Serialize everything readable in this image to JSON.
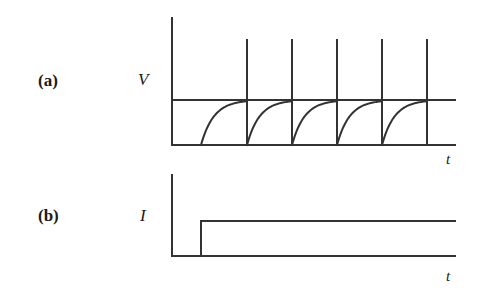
{
  "figure": {
    "background": "#ffffff",
    "line_color": "#333333",
    "width": 477,
    "height": 294
  },
  "panels": [
    {
      "id": "a",
      "label": "(a)",
      "label_x": 38,
      "label_y": 72,
      "y_axis_label": "V",
      "y_axis_label_x": 138,
      "y_axis_label_y": 71,
      "x_axis_label": "t",
      "x_axis_label_x": 446,
      "x_axis_label_y": 152,
      "quantity": "voltage"
    },
    {
      "id": "b",
      "label": "(b)",
      "label_x": 38,
      "label_y": 207,
      "y_axis_label": "I",
      "y_axis_label_x": 140,
      "y_axis_label_y": 207,
      "x_axis_label": "t",
      "x_axis_label_x": 446,
      "x_axis_label_y": 269,
      "quantity": "current"
    }
  ],
  "chart_data": [
    {
      "type": "line",
      "title": "(a) Voltage versus time",
      "xlabel": "t",
      "ylabel": "V",
      "grid": false,
      "legend": false,
      "axes": {
        "origin_x": 172,
        "baseline_y": 145,
        "axis_top_y": 18,
        "axis_right_x": 455
      },
      "levels": {
        "baseline": 145,
        "plateau": 100,
        "spike_top": 40
      },
      "plateau_line": {
        "x_start": 172,
        "x_end": 455,
        "y": 100
      },
      "spikes": [
        {
          "x": 247,
          "y_top": 40,
          "y_bottom": 145
        },
        {
          "x": 292,
          "y_top": 40,
          "y_bottom": 145
        },
        {
          "x": 337,
          "y_top": 40,
          "y_bottom": 145
        },
        {
          "x": 382,
          "y_top": 40,
          "y_bottom": 145
        },
        {
          "x": 427,
          "y_top": 40,
          "y_bottom": 145
        }
      ],
      "charging_curves": [
        {
          "x_start": 201,
          "x_end": 247
        },
        {
          "x_start": 247,
          "x_end": 292
        },
        {
          "x_start": 292,
          "x_end": 337
        },
        {
          "x_start": 337,
          "x_end": 382
        },
        {
          "x_start": 382,
          "x_end": 427
        }
      ],
      "description": "Sawtooth relaxation oscillation: exponential charging curves rise from baseline to a plateau level, each terminated by a vertical spike extending above the plateau."
    },
    {
      "type": "line",
      "title": "(b) Current versus time",
      "xlabel": "t",
      "ylabel": "I",
      "grid": false,
      "legend": false,
      "axes": {
        "origin_x": 172,
        "baseline_y": 256,
        "axis_top_y": 175,
        "axis_right_x": 455
      },
      "step": {
        "x_step": 201,
        "y_low": 256,
        "y_high": 221,
        "x_end": 455
      },
      "description": "Step function: current is zero until the switch time, then jumps to a constant steady value."
    }
  ]
}
